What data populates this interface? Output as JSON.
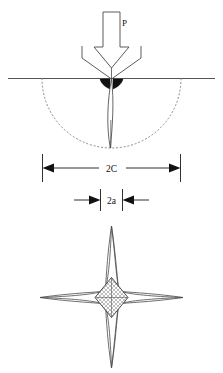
{
  "figure": {
    "background_color": "#ffffff",
    "line_color": "#3a3a3a",
    "dim_line_color": "#1a1a1a",
    "fill_dark": "#111111",
    "width": 223,
    "height": 373
  },
  "labels": {
    "load": "P",
    "crack_length": "2C",
    "indent_diagonal": "2a"
  },
  "views": {
    "cross_section": {
      "name": "cross-section-view",
      "surface_line_label": "specimen surface",
      "indenter_label": "vickers indenter",
      "plastic_zone_label": "plastic zone",
      "median_crack_label": "median crack"
    },
    "plan": {
      "name": "plan-view",
      "indent_label": "vickers indent impression",
      "radial_cracks_label": "radial cracks"
    }
  },
  "dimensions": {
    "outer": {
      "label": "2C",
      "arrow_direction": "outward",
      "x_left": 42,
      "x_right": 180,
      "y": 168
    },
    "inner": {
      "label": "2a",
      "arrow_direction": "inward",
      "x_left": 74,
      "x_right": 148,
      "y": 200
    }
  }
}
